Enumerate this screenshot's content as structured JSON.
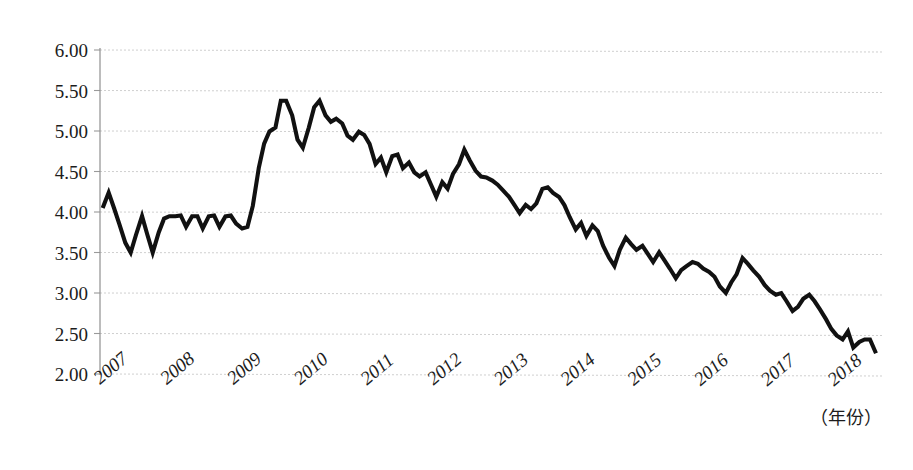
{
  "chart_data": {
    "type": "line",
    "title": "",
    "subtitle": "",
    "xlabel": "（年份）",
    "ylabel": "",
    "xlim": [
      2007.0,
      2018.75
    ],
    "ylim": [
      2.0,
      6.0
    ],
    "grid": true,
    "legend": null,
    "legend_position": "none",
    "y_ticks": [
      "2.00",
      "2.50",
      "3.00",
      "3.50",
      "4.00",
      "4.50",
      "5.00",
      "5.50",
      "6.00"
    ],
    "y_tick_values": [
      2.0,
      2.5,
      3.0,
      3.5,
      4.0,
      4.5,
      5.0,
      5.5,
      6.0
    ],
    "x_ticks": [
      "2007",
      "2008",
      "2009",
      "2010",
      "2011",
      "2012",
      "2013",
      "2014",
      "2015",
      "2016",
      "2017",
      "2018"
    ],
    "x_tick_values": [
      2007,
      2008,
      2009,
      2010,
      2011,
      2012,
      2013,
      2014,
      2015,
      2016,
      2017,
      2018
    ],
    "x_tick_rotation": -40,
    "series": [
      {
        "name": "series-1",
        "color": "#111111",
        "x": [
          2007.04,
          2007.13,
          2007.21,
          2007.29,
          2007.38,
          2007.46,
          2007.54,
          2007.63,
          2007.71,
          2007.79,
          2007.88,
          2007.96,
          2008.04,
          2008.13,
          2008.21,
          2008.29,
          2008.38,
          2008.46,
          2008.54,
          2008.63,
          2008.71,
          2008.79,
          2008.88,
          2008.96,
          2009.04,
          2009.13,
          2009.21,
          2009.29,
          2009.38,
          2009.46,
          2009.54,
          2009.63,
          2009.71,
          2009.79,
          2009.88,
          2009.96,
          2010.04,
          2010.13,
          2010.21,
          2010.29,
          2010.38,
          2010.46,
          2010.54,
          2010.63,
          2010.71,
          2010.79,
          2010.88,
          2010.96,
          2011.04,
          2011.13,
          2011.21,
          2011.29,
          2011.38,
          2011.46,
          2011.54,
          2011.63,
          2011.71,
          2011.79,
          2011.88,
          2011.96,
          2012.04,
          2012.13,
          2012.21,
          2012.29,
          2012.38,
          2012.46,
          2012.54,
          2012.63,
          2012.71,
          2012.79,
          2012.88,
          2012.96,
          2013.04,
          2013.13,
          2013.21,
          2013.29,
          2013.38,
          2013.46,
          2013.54,
          2013.63,
          2013.71,
          2013.79,
          2013.88,
          2013.96,
          2014.04,
          2014.13,
          2014.21,
          2014.29,
          2014.38,
          2014.46,
          2014.54,
          2014.63,
          2014.71,
          2014.79,
          2014.88,
          2014.96,
          2015.04,
          2015.13,
          2015.21,
          2015.29,
          2015.38,
          2015.46,
          2015.54,
          2015.63,
          2015.71,
          2015.79,
          2015.88,
          2015.96,
          2016.04,
          2016.13,
          2016.21,
          2016.29,
          2016.38,
          2016.46,
          2016.54,
          2016.63,
          2016.71,
          2016.79,
          2016.88,
          2016.96,
          2017.04,
          2017.13,
          2017.21,
          2017.29,
          2017.38,
          2017.46,
          2017.54,
          2017.63,
          2017.71,
          2017.79,
          2017.88,
          2017.96,
          2018.04,
          2018.13,
          2018.21,
          2018.29,
          2018.38,
          2018.46,
          2018.54,
          2018.63
        ],
        "values": [
          4.05,
          4.24,
          4.05,
          3.85,
          3.62,
          3.5,
          3.72,
          3.95,
          3.72,
          3.5,
          3.75,
          3.92,
          3.95,
          3.95,
          3.96,
          3.82,
          3.95,
          3.95,
          3.8,
          3.95,
          3.96,
          3.82,
          3.95,
          3.96,
          3.86,
          3.8,
          3.82,
          4.08,
          4.55,
          4.85,
          5.0,
          5.05,
          5.38,
          5.38,
          5.2,
          4.9,
          4.8,
          5.05,
          5.3,
          5.38,
          5.2,
          5.12,
          5.16,
          5.1,
          4.95,
          4.9,
          5.0,
          4.96,
          4.85,
          4.6,
          4.68,
          4.5,
          4.7,
          4.72,
          4.55,
          4.62,
          4.5,
          4.45,
          4.5,
          4.35,
          4.2,
          4.38,
          4.3,
          4.48,
          4.6,
          4.78,
          4.65,
          4.52,
          4.45,
          4.44,
          4.4,
          4.35,
          4.28,
          4.2,
          4.1,
          4.0,
          4.1,
          4.05,
          4.12,
          4.3,
          4.32,
          4.25,
          4.2,
          4.1,
          3.95,
          3.8,
          3.88,
          3.72,
          3.85,
          3.78,
          3.6,
          3.45,
          3.35,
          3.55,
          3.7,
          3.62,
          3.55,
          3.6,
          3.5,
          3.4,
          3.52,
          3.42,
          3.32,
          3.2,
          3.3,
          3.35,
          3.4,
          3.38,
          3.32,
          3.28,
          3.22,
          3.1,
          3.02,
          3.15,
          3.25,
          3.45,
          3.38,
          3.3,
          3.22,
          3.12,
          3.05,
          3.0,
          3.02,
          2.92,
          2.8,
          2.85,
          2.95,
          3.0,
          2.92,
          2.82,
          2.7,
          2.58,
          2.5,
          2.45,
          2.55,
          2.35,
          2.42,
          2.45,
          2.45,
          2.28
        ]
      }
    ]
  },
  "axis": {
    "x_axis_title": "（年份）"
  }
}
